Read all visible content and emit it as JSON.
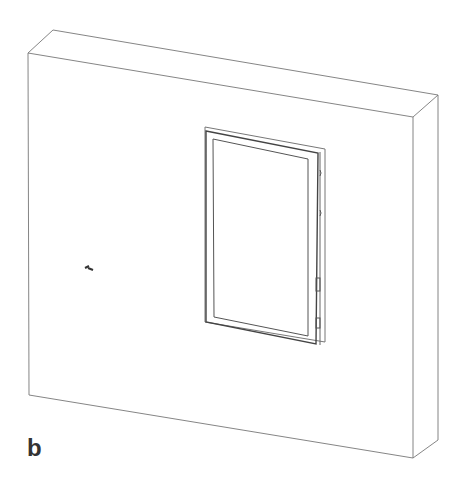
{
  "figure": {
    "panel_label": "b",
    "line_color": "#6e6e6e",
    "dark_line_color": "#444444",
    "background": "#ffffff"
  }
}
